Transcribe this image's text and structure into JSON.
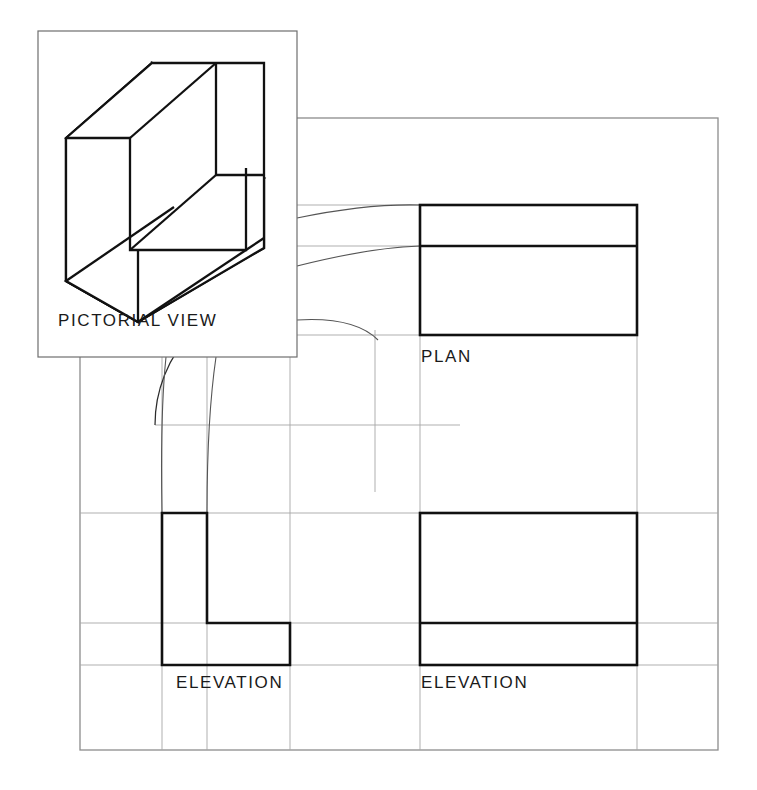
{
  "drawing": {
    "title": "Orthographic Projection Exercise",
    "type": "first-angle-projection-layout",
    "background_color": "#ffffff",
    "ink_color": "#1a1a1a",
    "construction_line_color": "#9a9a9a",
    "frame_color": "#8c8c8c"
  },
  "labels": {
    "pictorial": "PICTORIAL VIEW",
    "plan": "PLAN",
    "elevation_left": "ELEVATION",
    "elevation_right": "ELEVATION"
  },
  "views": {
    "pictorial": {
      "name": "PICTORIAL VIEW",
      "box": {
        "x": 38,
        "y": 31,
        "width": 259,
        "height": 326
      },
      "object": "L-shaped angle block drawn in isometric projection"
    },
    "plan": {
      "name": "PLAN",
      "rect": {
        "x": 420,
        "y": 205,
        "width": 217,
        "height": 130
      },
      "divider_y": 246,
      "description": "Rectangle with horizontal division line near the top edge"
    },
    "elevation_left": {
      "name": "ELEVATION",
      "outline": "L-shape",
      "rect": {
        "x": 162,
        "y": 513,
        "width": 128,
        "height": 152
      },
      "notch_x": 207,
      "notch_y": 623,
      "description": "L-shaped end elevation with notch at upper right"
    },
    "elevation_right": {
      "name": "ELEVATION",
      "rect": {
        "x": 420,
        "y": 513,
        "width": 217,
        "height": 152
      },
      "divider_y": 623,
      "description": "Rectangle with horizontal division line near the bottom edge"
    }
  },
  "frame": {
    "x": 80,
    "y": 118,
    "width": 638,
    "height": 632
  },
  "miter_arc": {
    "center_x": 290,
    "center_y": 425,
    "radius": 135,
    "description": "Quarter circle mitre line used to transfer widths between plan and elevation"
  }
}
